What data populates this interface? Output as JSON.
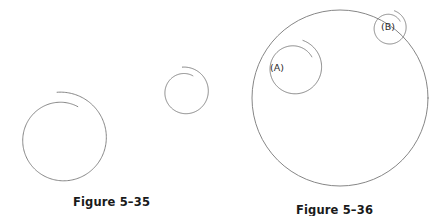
{
  "page": {
    "background_color": "#ffffff",
    "stroke_color": "#787878",
    "text_color": "#1a1a1a",
    "width": 446,
    "height": 216
  },
  "figures": [
    {
      "id": "figure-5-35",
      "caption": "Figure 5–35",
      "description": "Two separate Archimedean spirals of different sizes",
      "shapes": [
        {
          "name": "large-spiral",
          "type": "spiral",
          "center_x": 62,
          "center_y": 139,
          "start_radius": 47,
          "end_radius": 36,
          "start_angle_deg": -96,
          "sweep_deg": 392
        },
        {
          "name": "small-spiral",
          "type": "spiral",
          "center_x": 185,
          "center_y": 92,
          "start_radius": 25,
          "end_radius": 18,
          "start_angle_deg": -96,
          "sweep_deg": 392
        }
      ]
    },
    {
      "id": "figure-5-36",
      "caption": "Figure 5–36",
      "description": "A large circle enclosing two labeled spirals tangent to its rim",
      "shapes": [
        {
          "name": "outer-circle",
          "type": "circle",
          "center_x": 340,
          "center_y": 98,
          "radius": 88
        },
        {
          "name": "spiral-a",
          "type": "spiral",
          "center_x": 294,
          "center_y": 68,
          "start_radius": 29,
          "end_radius": 21,
          "start_angle_deg": -72,
          "sweep_deg": 400
        },
        {
          "name": "spiral-b",
          "type": "spiral",
          "center_x": 389,
          "center_y": 28,
          "start_radius": 18,
          "end_radius": 13,
          "start_angle_deg": -72,
          "sweep_deg": 400
        }
      ],
      "labels": [
        {
          "name": "label-a",
          "text": "(A)",
          "x": 270,
          "y": 62
        },
        {
          "name": "label-b",
          "text": "(B)",
          "x": 381,
          "y": 21
        }
      ]
    }
  ],
  "chart_data": {
    "type": "diagram",
    "title": "",
    "figure_captions": [
      "Figure 5–35",
      "Figure 5–36"
    ],
    "annotations": [
      "(A)",
      "(B)"
    ]
  }
}
